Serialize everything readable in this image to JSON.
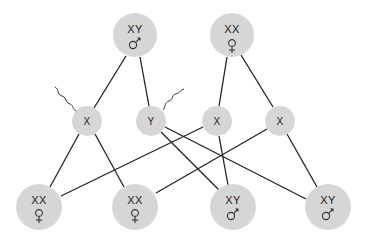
{
  "diagram": {
    "colors": {
      "node_fill": "#d6d6d6",
      "line": "#222222",
      "text": "#222222",
      "background": "#ffffff"
    },
    "parents": [
      {
        "id": "father",
        "label": "XY",
        "sex": "male",
        "symbol": "male-symbol",
        "cx": 135,
        "cy": 35,
        "r": 22
      },
      {
        "id": "mother",
        "label": "XX",
        "sex": "female",
        "symbol": "female-symbol",
        "cx": 232,
        "cy": 35,
        "r": 22
      }
    ],
    "gametes": [
      {
        "id": "sperm-x",
        "label": "X",
        "type": "sperm",
        "cx": 87,
        "cy": 121,
        "r": 15
      },
      {
        "id": "sperm-y",
        "label": "Y",
        "type": "sperm",
        "cx": 151,
        "cy": 121,
        "r": 15
      },
      {
        "id": "egg-x-1",
        "label": "X",
        "type": "egg",
        "cx": 217,
        "cy": 121,
        "r": 15
      },
      {
        "id": "egg-x-2",
        "label": "X",
        "type": "egg",
        "cx": 280,
        "cy": 121,
        "r": 15
      }
    ],
    "offspring": [
      {
        "id": "child-1",
        "label": "XX",
        "sex": "female",
        "symbol": "female-symbol",
        "cx": 39,
        "cy": 207,
        "r": 23
      },
      {
        "id": "child-2",
        "label": "XX",
        "sex": "female",
        "symbol": "female-symbol",
        "cx": 135,
        "cy": 207,
        "r": 23
      },
      {
        "id": "child-3",
        "label": "XY",
        "sex": "male",
        "symbol": "male-symbol",
        "cx": 233,
        "cy": 207,
        "r": 23
      },
      {
        "id": "child-4",
        "label": "XY",
        "sex": "male",
        "symbol": "male-symbol",
        "cx": 328,
        "cy": 207,
        "r": 23
      }
    ],
    "edges": [
      {
        "from": "father",
        "to": "sperm-x"
      },
      {
        "from": "father",
        "to": "sperm-y"
      },
      {
        "from": "mother",
        "to": "egg-x-1"
      },
      {
        "from": "mother",
        "to": "egg-x-2"
      },
      {
        "from": "sperm-x",
        "to": "child-1"
      },
      {
        "from": "sperm-x",
        "to": "child-2"
      },
      {
        "from": "egg-x-1",
        "to": "child-1"
      },
      {
        "from": "egg-x-1",
        "to": "child-3"
      },
      {
        "from": "egg-x-2",
        "to": "child-2"
      },
      {
        "from": "egg-x-2",
        "to": "child-4"
      },
      {
        "from": "sperm-y",
        "to": "child-3"
      },
      {
        "from": "sperm-y",
        "to": "child-4"
      }
    ]
  }
}
